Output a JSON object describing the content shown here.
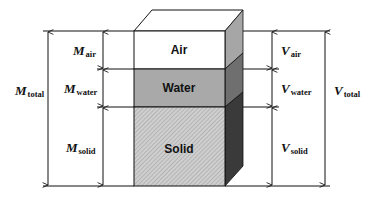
{
  "diagram": {
    "type": "three-phase soil block diagram",
    "phases": [
      {
        "name": "Air",
        "front_color": "#ffffff",
        "side_color": "#a6a6a6"
      },
      {
        "name": "Water",
        "front_color": "#a9a9a9",
        "side_color": "#6f6f6f"
      },
      {
        "name": "Solid",
        "front_color": "#c8c8c8",
        "side_color": "#3a3a3a",
        "hatched": true
      }
    ],
    "mass_labels": {
      "total": {
        "symbol": "M",
        "subscript": "total"
      },
      "air": {
        "symbol": "M",
        "subscript": "air"
      },
      "water": {
        "symbol": "M",
        "subscript": "water"
      },
      "solid": {
        "symbol": "M",
        "subscript": "solid"
      }
    },
    "volume_labels": {
      "total": {
        "symbol": "V",
        "subscript": "total"
      },
      "air": {
        "symbol": "V",
        "subscript": "air"
      },
      "water": {
        "symbol": "V",
        "subscript": "water"
      },
      "solid": {
        "symbol": "V",
        "subscript": "solid"
      }
    }
  }
}
